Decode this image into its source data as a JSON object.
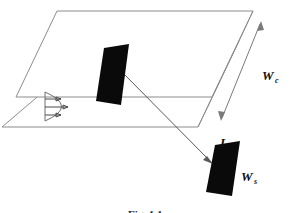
{
  "figure": {
    "type": "technical-line-diagram",
    "background_color": "#ffffff",
    "line_color": "#8c8c8c",
    "shape_color": "#0a0a0a",
    "width": 292,
    "height": 213
  },
  "labels": {
    "channel_width": {
      "symbol": "W",
      "subscript": "c",
      "x": 264,
      "y": 79
    },
    "sensor_length": {
      "symbol": "L",
      "subscript": "",
      "x": 222,
      "y": 146
    },
    "sensor_width": {
      "symbol": "W",
      "subscript": "s",
      "x": 243,
      "y": 180
    }
  },
  "caption": {
    "text": "Fig. 1.1",
    "visible_fragment": true,
    "x": 146,
    "y": 210
  },
  "elements": {
    "upper_plane": {
      "name": "channel-top-plate",
      "points": "57,11 253,11 212,97 16,97"
    },
    "lower_plane": {
      "name": "channel-bottom-plate",
      "points": "43,41 239,41 198,127 2,127"
    },
    "right_edge_upper": {
      "points": "253,11 253,29"
    },
    "channel_sensor": {
      "name": "embedded-sensor-patch",
      "points": "104,48 129,44 121,105 96,101"
    },
    "detail_sensor": {
      "name": "detail-sensor-patch",
      "points": "215,145 240,141 232,196 206,192"
    },
    "pointer_arrow": {
      "name": "sensor-detail-callout",
      "from_x": 122,
      "from_y": 72,
      "to_x": 212,
      "to_y": 163
    },
    "dimension_arrow": {
      "name": "channel-width-dimension",
      "from_x": 261,
      "from_y": 23,
      "to_x": 221,
      "to_y": 120
    }
  },
  "velocity_profile": {
    "name": "parabolic-flow-profile",
    "arrow_count": 3,
    "wall_top_y": 92,
    "wall_bottom_y": 121,
    "base_x": 45,
    "peak_x": 70,
    "arrows": [
      {
        "y": 99,
        "tip_x": 62
      },
      {
        "y": 107,
        "tip_x": 69
      },
      {
        "y": 115,
        "tip_x": 62
      }
    ]
  }
}
